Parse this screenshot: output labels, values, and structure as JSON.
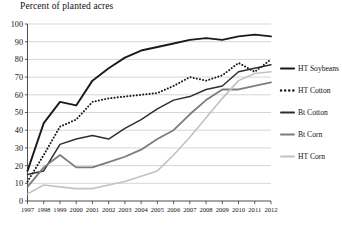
{
  "chart_data": {
    "type": "line",
    "title": "Percent of planted acres",
    "xlabel": "",
    "ylabel": "Percent of planted acres",
    "xlim": [
      1997,
      2012
    ],
    "ylim": [
      0,
      100
    ],
    "grid": true,
    "legend_position": "right",
    "x": [
      1997,
      1998,
      1999,
      2000,
      2001,
      2002,
      2003,
      2004,
      2005,
      2006,
      2007,
      2008,
      2009,
      2010,
      2011,
      2012
    ],
    "xtick_labels": [
      "1997",
      "1998",
      "1999",
      "2000",
      "2001",
      "2002",
      "2003",
      "2004",
      "2005",
      "2006",
      "2007",
      "2008",
      "2009",
      "2010",
      "2011",
      "2012"
    ],
    "ytick_labels": [
      "0",
      "10",
      "20",
      "30",
      "40",
      "50",
      "60",
      "70",
      "80",
      "90",
      "100"
    ],
    "ytick_values": [
      0,
      10,
      20,
      30,
      40,
      50,
      60,
      70,
      80,
      90,
      100
    ],
    "series": [
      {
        "name": "HT Soybeans",
        "color": "#1a1a1a",
        "style": "solid",
        "width": 1.9,
        "values": [
          17,
          44,
          56,
          54,
          68,
          75,
          81,
          85,
          87,
          89,
          91,
          92,
          91,
          93,
          94,
          93
        ]
      },
      {
        "name": "HT Cotton",
        "color": "#1a1a1a",
        "style": "dotted",
        "width": 2.0,
        "values": [
          11,
          26,
          42,
          46,
          56,
          58,
          59,
          60,
          61,
          65,
          70,
          68,
          71,
          78,
          73,
          80
        ]
      },
      {
        "name": "Bt Cotton",
        "color": "#2e2e2e",
        "style": "solid",
        "width": 1.5,
        "values": [
          15,
          17,
          32,
          35,
          37,
          35,
          41,
          46,
          52,
          57,
          59,
          63,
          65,
          73,
          75,
          77
        ]
      },
      {
        "name": "Bt Corn",
        "color": "#7c7c7c",
        "style": "solid",
        "width": 1.8,
        "values": [
          8,
          19,
          26,
          19,
          19,
          22,
          25,
          29,
          35,
          40,
          49,
          57,
          63,
          63,
          65,
          67
        ]
      },
      {
        "name": "HT Corn",
        "color": "#c2c2c2",
        "style": "solid",
        "width": 1.6,
        "values": [
          4,
          9,
          8,
          7,
          7,
          9,
          11,
          14,
          17,
          26,
          36,
          47,
          58,
          68,
          72,
          73
        ]
      }
    ],
    "legend": [
      {
        "label": "HT Soybeans",
        "color": "#1a1a1a",
        "style": "solid",
        "width": 2.2
      },
      {
        "label": "HT Cotton",
        "color": "#1a1a1a",
        "style": "dotted",
        "width": 2.4
      },
      {
        "label": "Bt Cotton",
        "color": "#2e2e2e",
        "style": "solid",
        "width": 2.0
      },
      {
        "label": "Bt Corn",
        "color": "#7c7c7c",
        "style": "solid",
        "width": 2.0
      },
      {
        "label": "HT Corn",
        "color": "#c2c2c2",
        "style": "solid",
        "width": 2.0
      }
    ]
  }
}
